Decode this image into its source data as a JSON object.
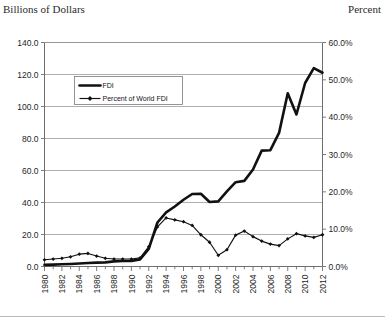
{
  "chart_data": {
    "type": "line",
    "title": "",
    "xlabel": "",
    "ylabel": "Billions of Dollars",
    "y2label": "Percent",
    "x": [
      1980,
      1981,
      1982,
      1983,
      1984,
      1985,
      1986,
      1987,
      1988,
      1989,
      1990,
      1991,
      1992,
      1993,
      1994,
      1995,
      1996,
      1997,
      1998,
      1999,
      2000,
      2001,
      2002,
      2003,
      2004,
      2005,
      2006,
      2007,
      2008,
      2009,
      2010,
      2011,
      2012
    ],
    "xtick_labels": [
      "1980",
      "1982",
      "1984",
      "1986",
      "1988",
      "1990",
      "1992",
      "1994",
      "1996",
      "1998",
      "2000",
      "2002",
      "2004",
      "2006",
      "2008",
      "2010",
      "2012"
    ],
    "xlim": [
      1980,
      2012
    ],
    "ylim": [
      0,
      140
    ],
    "ytick_labels": [
      "0.0",
      "20.0",
      "40.0",
      "60.0",
      "80.0",
      "100.0",
      "120.0",
      "140.0"
    ],
    "ytick_values": [
      0,
      20,
      40,
      60,
      80,
      100,
      120,
      140
    ],
    "y2lim": [
      0,
      60
    ],
    "y2tick_labels": [
      "0.0%",
      "10.0%",
      "20.0%",
      "30.0%",
      "40.0%",
      "50.0%",
      "60.0%"
    ],
    "y2tick_values": [
      0,
      10,
      20,
      30,
      40,
      50,
      60
    ],
    "grid": "horizontal",
    "legend_position": "upper-left-inside",
    "series": [
      {
        "name": "FDI",
        "axis": "left",
        "unit": "Billions of Dollars",
        "marker": "none",
        "values": [
          1.0,
          1.2,
          1.4,
          1.6,
          1.9,
          2.2,
          2.4,
          2.6,
          3.2,
          3.4,
          3.5,
          4.4,
          11.0,
          27.5,
          33.8,
          37.5,
          41.7,
          45.3,
          45.5,
          40.3,
          40.7,
          46.9,
          52.7,
          53.5,
          60.6,
          72.4,
          72.7,
          83.5,
          108.3,
          95.0,
          114.7,
          124.0,
          121.1
        ]
      },
      {
        "name": "Percent of World FDI",
        "axis": "right",
        "unit": "Percent",
        "marker": "diamond",
        "values": [
          1.8,
          2.0,
          2.2,
          2.6,
          3.3,
          3.5,
          2.8,
          2.2,
          2.0,
          2.0,
          2.0,
          2.3,
          5.3,
          10.6,
          13.0,
          12.5,
          12.0,
          11.0,
          8.5,
          6.5,
          3.0,
          4.5,
          8.4,
          9.5,
          8.0,
          6.8,
          6.0,
          5.6,
          7.4,
          8.8,
          8.2,
          7.8,
          8.5
        ]
      }
    ]
  },
  "legend": {
    "items": [
      {
        "label": "FDI"
      },
      {
        "label": "Percent of World FDI"
      }
    ]
  },
  "colors": {
    "series": "#111111",
    "grid": "#8c8c8c",
    "axis": "#6e6e6e",
    "background": "#ffffff"
  }
}
